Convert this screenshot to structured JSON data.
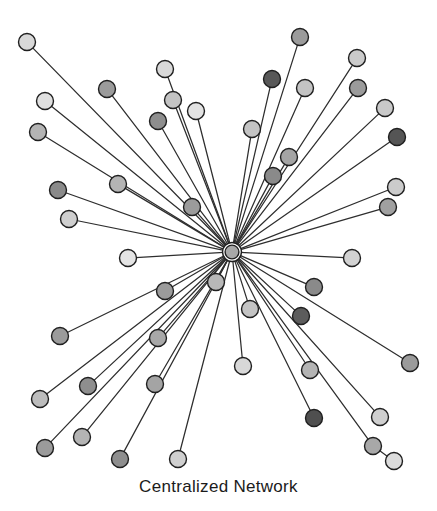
{
  "figure": {
    "title": "Centralized Network",
    "caption": "Centralized Network",
    "background_color": "#ffffff",
    "edge_color": "#2e2e2e",
    "node_stroke_color": "#1f1f1f",
    "width": 437,
    "height": 511
  },
  "chart_data": {
    "type": "scatter",
    "title": "Centralized Network",
    "subtitle": "",
    "xlabel": "",
    "ylabel": "",
    "xlim": [
      0,
      437
    ],
    "ylim": [
      0,
      511
    ],
    "grid": false,
    "legend": "none",
    "layout": "star / hub-and-spoke",
    "node_count": 46,
    "edge_count": 45,
    "hub": {
      "id": "hub",
      "label": "central hub",
      "x": 232,
      "y": 252,
      "r": 9.5,
      "fill": "#a8a8a8",
      "ring": true
    },
    "leaf_nodes": [
      {
        "id": "n01",
        "x": 27,
        "y": 42,
        "r": 8.5,
        "fill": "#d8d8d8"
      },
      {
        "id": "n02",
        "x": 107,
        "y": 89,
        "r": 8.5,
        "fill": "#9b9b9b"
      },
      {
        "id": "n03",
        "x": 45,
        "y": 101,
        "r": 8.5,
        "fill": "#e0e0e0"
      },
      {
        "id": "n04",
        "x": 38,
        "y": 132,
        "r": 8.5,
        "fill": "#b4b4b4"
      },
      {
        "id": "n05",
        "x": 165,
        "y": 69,
        "r": 8.5,
        "fill": "#d8d8d8"
      },
      {
        "id": "n06",
        "x": 173,
        "y": 100,
        "r": 8.5,
        "fill": "#c3c3c3"
      },
      {
        "id": "n07",
        "x": 196,
        "y": 111,
        "r": 8.5,
        "fill": "#e2e2e2"
      },
      {
        "id": "n08",
        "x": 158,
        "y": 121,
        "r": 8.5,
        "fill": "#8e8e8e"
      },
      {
        "id": "n09",
        "x": 118,
        "y": 184,
        "r": 8.5,
        "fill": "#b4b4b4"
      },
      {
        "id": "n10",
        "x": 58,
        "y": 190,
        "r": 8.5,
        "fill": "#8a8a8a"
      },
      {
        "id": "n11",
        "x": 69,
        "y": 219,
        "r": 8.5,
        "fill": "#cfcfcf"
      },
      {
        "id": "n12",
        "x": 192,
        "y": 207,
        "r": 8.5,
        "fill": "#9b9b9b"
      },
      {
        "id": "n13",
        "x": 128,
        "y": 258,
        "r": 8.5,
        "fill": "#e4e4e4"
      },
      {
        "id": "n14",
        "x": 300,
        "y": 37,
        "r": 8.5,
        "fill": "#9b9b9b"
      },
      {
        "id": "n15",
        "x": 272,
        "y": 79,
        "r": 8.5,
        "fill": "#585858"
      },
      {
        "id": "n16",
        "x": 305,
        "y": 88,
        "r": 8.5,
        "fill": "#c3c3c3"
      },
      {
        "id": "n17",
        "x": 357,
        "y": 58,
        "r": 8.5,
        "fill": "#cbcbcb"
      },
      {
        "id": "n18",
        "x": 358,
        "y": 88,
        "r": 8.5,
        "fill": "#9b9b9b"
      },
      {
        "id": "n19",
        "x": 385,
        "y": 108,
        "r": 8.5,
        "fill": "#c9c9c9"
      },
      {
        "id": "n20",
        "x": 397,
        "y": 137,
        "r": 8.5,
        "fill": "#555555"
      },
      {
        "id": "n21",
        "x": 252,
        "y": 129,
        "r": 8.5,
        "fill": "#c3c3c3"
      },
      {
        "id": "n22",
        "x": 289,
        "y": 157,
        "r": 8.5,
        "fill": "#a4a4a4"
      },
      {
        "id": "n23",
        "x": 273,
        "y": 176,
        "r": 8.5,
        "fill": "#8a8a8a"
      },
      {
        "id": "n24",
        "x": 396,
        "y": 187,
        "r": 8.5,
        "fill": "#cbcbcb"
      },
      {
        "id": "n25",
        "x": 388,
        "y": 207,
        "r": 8.5,
        "fill": "#a0a0a0"
      },
      {
        "id": "n26",
        "x": 352,
        "y": 258,
        "r": 8.5,
        "fill": "#d2d2d2"
      },
      {
        "id": "n27",
        "x": 216,
        "y": 282,
        "r": 8.5,
        "fill": "#b8b8b8"
      },
      {
        "id": "n28",
        "x": 165,
        "y": 291,
        "r": 8.5,
        "fill": "#9b9b9b"
      },
      {
        "id": "n29",
        "x": 60,
        "y": 336,
        "r": 8.5,
        "fill": "#9b9b9b"
      },
      {
        "id": "n30",
        "x": 158,
        "y": 338,
        "r": 8.5,
        "fill": "#a8a8a8"
      },
      {
        "id": "n31",
        "x": 40,
        "y": 399,
        "r": 8.5,
        "fill": "#bcbcbc"
      },
      {
        "id": "n32",
        "x": 88,
        "y": 386,
        "r": 8.5,
        "fill": "#8e8e8e"
      },
      {
        "id": "n33",
        "x": 155,
        "y": 384,
        "r": 8.5,
        "fill": "#a4a4a4"
      },
      {
        "id": "n34",
        "x": 45,
        "y": 448,
        "r": 8.5,
        "fill": "#9b9b9b"
      },
      {
        "id": "n35",
        "x": 82,
        "y": 437,
        "r": 8.5,
        "fill": "#b4b4b4"
      },
      {
        "id": "n36",
        "x": 120,
        "y": 459,
        "r": 8.5,
        "fill": "#8e8e8e"
      },
      {
        "id": "n37",
        "x": 178,
        "y": 459,
        "r": 8.5,
        "fill": "#cfcfcf"
      },
      {
        "id": "n38",
        "x": 243,
        "y": 366,
        "r": 8.5,
        "fill": "#d8d8d8"
      },
      {
        "id": "n39",
        "x": 250,
        "y": 309,
        "r": 8.5,
        "fill": "#c3c3c3"
      },
      {
        "id": "n40",
        "x": 310,
        "y": 370,
        "r": 8.5,
        "fill": "#b4b4b4"
      },
      {
        "id": "n41",
        "x": 314,
        "y": 287,
        "r": 8.5,
        "fill": "#8a8a8a"
      },
      {
        "id": "n42",
        "x": 301,
        "y": 316,
        "r": 8.5,
        "fill": "#5c5c5c"
      },
      {
        "id": "n43",
        "x": 410,
        "y": 363,
        "r": 8.5,
        "fill": "#9b9b9b"
      },
      {
        "id": "n44",
        "x": 314,
        "y": 418,
        "r": 8.5,
        "fill": "#4f4f4f"
      },
      {
        "id": "n45",
        "x": 380,
        "y": 417,
        "r": 8.5,
        "fill": "#cfcfcf"
      },
      {
        "id": "n46",
        "x": 373,
        "y": 446,
        "r": 8.5,
        "fill": "#a8a8a8"
      },
      {
        "id": "n47",
        "x": 394,
        "y": 461,
        "r": 8.5,
        "fill": "#dcdcdc"
      }
    ],
    "edges_from_hub_to": [
      "n01",
      "n02",
      "n03",
      "n04",
      "n05",
      "n06",
      "n07",
      "n08",
      "n09",
      "n10",
      "n11",
      "n12",
      "n13",
      "n14",
      "n15",
      "n16",
      "n17",
      "n18",
      "n19",
      "n20",
      "n21",
      "n22",
      "n23",
      "n24",
      "n25",
      "n26",
      "n27",
      "n28",
      "n29",
      "n30",
      "n31",
      "n32",
      "n33",
      "n34",
      "n35",
      "n36",
      "n37",
      "n38",
      "n39",
      "n40",
      "n41",
      "n42",
      "n43",
      "n44",
      "n45",
      "n46"
    ],
    "chained_edges": [
      {
        "from": "n46",
        "to": "n47"
      }
    ]
  }
}
